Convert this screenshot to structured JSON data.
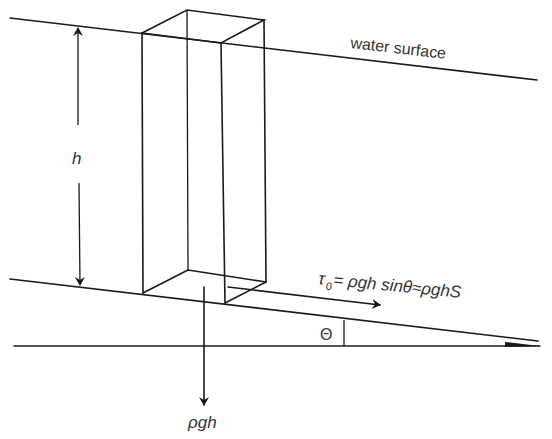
{
  "diagram": {
    "labels": {
      "water_surface": "water surface",
      "depth": "h",
      "shear_stress": "τ₀= ρgh sinθ≈ρghS",
      "shear_symbol": "τ",
      "shear_subscript": "0",
      "shear_rhs": "= ρgh sinθ≈ρghS",
      "angle": "Θ",
      "weight": "ρgh"
    },
    "elements": [
      "water surface line",
      "channel bed line",
      "horizontal reference line",
      "water column box",
      "depth arrow h",
      "shear stress arrow",
      "weight arrow",
      "slope angle marker"
    ],
    "colors": {
      "line": "#1a1a1a",
      "text": "#333333",
      "background": "#ffffff"
    }
  }
}
